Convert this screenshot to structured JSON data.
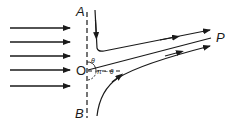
{
  "diagram": {
    "labels": {
      "A": "A",
      "B": "B",
      "O": "O",
      "P": "P",
      "theta": "θ",
      "pi_minus_theta": "π − θ"
    },
    "incoming_arrows_count": 5,
    "stroke_color": "#1a1a1a"
  }
}
